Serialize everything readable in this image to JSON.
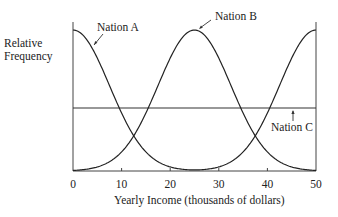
{
  "chart_data": {
    "type": "line",
    "title": "",
    "xlabel": "Yearly Income (thousands of dollars)",
    "ylabel": "Relative Frequency",
    "xlim": [
      0,
      50
    ],
    "ylim": [
      0,
      1
    ],
    "x_ticks": [
      "0",
      "10",
      "20",
      "30",
      "40",
      "50"
    ],
    "grid": false,
    "legend": "inline annotations with arrows",
    "series": [
      {
        "name": "Nation A",
        "shape": "bell curve peaked at income 0, decreasing to ~0 by 25, rising again to peak at 50",
        "x": [
          0,
          5,
          10,
          12.5,
          15,
          20,
          25,
          30,
          35,
          37.5,
          40,
          45,
          50
        ],
        "values": [
          1.0,
          0.8,
          0.41,
          0.25,
          0.14,
          0.03,
          0.0,
          0.03,
          0.14,
          0.25,
          0.41,
          0.8,
          1.0
        ]
      },
      {
        "name": "Nation B",
        "shape": "bell curve peaked at income 25",
        "x": [
          0,
          5,
          10,
          12.5,
          15,
          20,
          25,
          30,
          35,
          37.5,
          40,
          45,
          50
        ],
        "values": [
          0.0,
          0.03,
          0.14,
          0.25,
          0.41,
          0.8,
          1.0,
          0.8,
          0.41,
          0.25,
          0.14,
          0.03,
          0.0
        ]
      },
      {
        "name": "Nation C",
        "shape": "uniform (flat line)",
        "x": [
          0,
          50
        ],
        "values": [
          0.44,
          0.44
        ]
      }
    ],
    "annotations": [
      "Nation A",
      "Nation B",
      "Nation C"
    ]
  },
  "labels": {
    "ylabel_line1": "Relative",
    "ylabel_line2": "Frequency",
    "xlabel": "Yearly Income (thousands of dollars)",
    "nation_a": "Nation A",
    "nation_b": "Nation B",
    "nation_c": "Nation C",
    "ticks": [
      "0",
      "10",
      "20",
      "30",
      "40",
      "50"
    ]
  }
}
